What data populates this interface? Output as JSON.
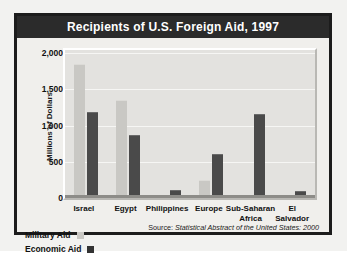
{
  "figure": {
    "title": "Recipients of U.S. Foreign Aid, 1997",
    "source_lead": "Source: ",
    "source_title": "Statistical Abstract of the United States: 2000",
    "colors": {
      "frame": "#1c1c1c",
      "title_bar": "#2b2b2b",
      "title_text": "#ffffff",
      "plot_background": "#e3e2df",
      "military_aid": "#c9c8c4",
      "economic_aid": "#4a4a4a"
    }
  },
  "legend": {
    "entries": [
      {
        "label": "Military Aid",
        "swatch": "military-aid-swatch"
      },
      {
        "label": "Economic Aid",
        "swatch": "economic-aid-swatch"
      }
    ]
  },
  "chart_data": {
    "type": "bar",
    "title": "Recipients of U.S. Foreign Aid, 1997",
    "xlabel": "",
    "ylabel": "Millions of Dollars",
    "ylim": [
      0,
      2000
    ],
    "yticks": [
      0,
      500,
      1000,
      1500,
      2000
    ],
    "ytick_labels": [
      "0",
      "500",
      "1,000",
      "1,500",
      "2,000"
    ],
    "grid": true,
    "legend_position": "below-left",
    "categories": [
      "Israel",
      "Egypt",
      "Philippines",
      "Europe",
      "Sub-Saharan Africa",
      "El Salvador"
    ],
    "category_lines": [
      [
        "Israel"
      ],
      [
        "Egypt"
      ],
      [
        "Philippines"
      ],
      [
        "Europe"
      ],
      [
        "Sub-Saharan",
        "Africa"
      ],
      [
        "El",
        "Salvador"
      ]
    ],
    "series": [
      {
        "name": "Military Aid",
        "values": [
          1800,
          1300,
          0,
          200,
          0,
          0
        ]
      },
      {
        "name": "Economic Aid",
        "values": [
          1130,
          815,
          60,
          550,
          1100,
          45
        ]
      }
    ]
  }
}
